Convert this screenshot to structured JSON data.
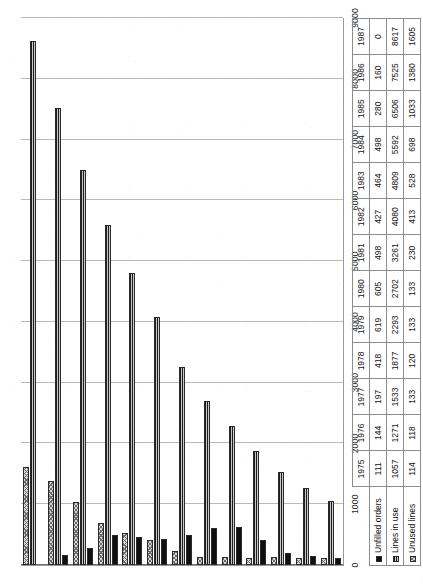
{
  "chart_data": {
    "type": "bar",
    "orientation": "horizontal",
    "title": "",
    "subtitle": "",
    "xlabel": "",
    "ylabel": "",
    "grid": true,
    "legend_position": "bottom-left-table",
    "axis_ticks": [
      "0",
      "1000",
      "2000",
      "3000",
      "4000",
      "5000",
      "6000",
      "7000",
      "8000",
      "9000"
    ],
    "ylim": [
      0,
      9000
    ],
    "categories": [
      "1975",
      "1976",
      "1977",
      "1978",
      "1979",
      "1980",
      "1981",
      "1982",
      "1983",
      "1984",
      "1985",
      "1986",
      "1987"
    ],
    "series": [
      {
        "name": "Unfilled orders",
        "key": "s0",
        "values": [
          111,
          144,
          197,
          418,
          619,
          605,
          498,
          427,
          464,
          498,
          280,
          160,
          0
        ]
      },
      {
        "name": "Lines in use",
        "key": "s1",
        "values": [
          1057,
          1271,
          1533,
          1877,
          2293,
          2702,
          3261,
          4080,
          4809,
          5592,
          6506,
          7525,
          8617
        ]
      },
      {
        "name": "Unused lines",
        "key": "s2",
        "values": [
          114,
          118,
          133,
          120,
          133,
          133,
          230,
          413,
          528,
          698,
          1033,
          1380,
          1605
        ]
      }
    ]
  },
  "table": {
    "corner_label": "",
    "row_labels": [
      "Unfilled orders",
      "Lines in use",
      "Unused lines"
    ]
  }
}
